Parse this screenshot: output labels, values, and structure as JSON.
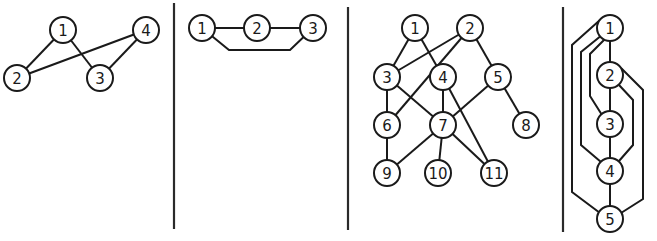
{
  "figure": {
    "panels": [
      {
        "id": "panel-1",
        "nodes": [
          {
            "id": "1",
            "label": "1",
            "x": 63,
            "y": 30
          },
          {
            "id": "2",
            "label": "2",
            "x": 17,
            "y": 78
          },
          {
            "id": "3",
            "label": "3",
            "x": 100,
            "y": 78
          },
          {
            "id": "4",
            "label": "4",
            "x": 146,
            "y": 30
          }
        ],
        "edges": [
          {
            "from": "1",
            "to": "2",
            "points": [
              [
                63,
                30
              ],
              [
                17,
                78
              ]
            ]
          },
          {
            "from": "1",
            "to": "3",
            "points": [
              [
                63,
                30
              ],
              [
                100,
                78
              ]
            ]
          },
          {
            "from": "2",
            "to": "4",
            "points": [
              [
                17,
                78
              ],
              [
                146,
                30
              ]
            ]
          },
          {
            "from": "3",
            "to": "4",
            "points": [
              [
                100,
                78
              ],
              [
                146,
                30
              ]
            ]
          }
        ]
      },
      {
        "id": "panel-2",
        "nodes": [
          {
            "id": "1",
            "label": "1",
            "x": 202,
            "y": 28
          },
          {
            "id": "2",
            "label": "2",
            "x": 257,
            "y": 28
          },
          {
            "id": "3",
            "label": "3",
            "x": 313,
            "y": 28
          }
        ],
        "edges": [
          {
            "from": "1",
            "to": "2",
            "points": [
              [
                202,
                28
              ],
              [
                257,
                28
              ]
            ]
          },
          {
            "from": "2",
            "to": "3",
            "points": [
              [
                257,
                28
              ],
              [
                313,
                28
              ]
            ]
          },
          {
            "from": "1",
            "to": "3",
            "points": [
              [
                202,
                28
              ],
              [
                229,
                50
              ],
              [
                290,
                50
              ],
              [
                313,
                28
              ]
            ]
          }
        ]
      },
      {
        "id": "panel-3",
        "nodes": [
          {
            "id": "1",
            "label": "1",
            "x": 415,
            "y": 28
          },
          {
            "id": "2",
            "label": "2",
            "x": 470,
            "y": 28
          },
          {
            "id": "3",
            "label": "3",
            "x": 387,
            "y": 77
          },
          {
            "id": "4",
            "label": "4",
            "x": 443,
            "y": 77
          },
          {
            "id": "5",
            "label": "5",
            "x": 498,
            "y": 77
          },
          {
            "id": "6",
            "label": "6",
            "x": 387,
            "y": 125
          },
          {
            "id": "7",
            "label": "7",
            "x": 443,
            "y": 125
          },
          {
            "id": "8",
            "label": "8",
            "x": 526,
            "y": 125
          },
          {
            "id": "9",
            "label": "9",
            "x": 387,
            "y": 173
          },
          {
            "id": "10",
            "label": "10",
            "x": 438,
            "y": 173
          },
          {
            "id": "11",
            "label": "11",
            "x": 494,
            "y": 173
          }
        ],
        "edges": [
          {
            "from": "1",
            "to": "3",
            "points": [
              [
                415,
                28
              ],
              [
                387,
                77
              ]
            ]
          },
          {
            "from": "1",
            "to": "4",
            "points": [
              [
                415,
                28
              ],
              [
                443,
                77
              ]
            ]
          },
          {
            "from": "2",
            "to": "3",
            "points": [
              [
                470,
                28
              ],
              [
                387,
                77
              ]
            ]
          },
          {
            "from": "2",
            "to": "6",
            "points": [
              [
                470,
                28
              ],
              [
                387,
                125
              ]
            ]
          },
          {
            "from": "2",
            "to": "5",
            "points": [
              [
                470,
                28
              ],
              [
                498,
                77
              ]
            ]
          },
          {
            "from": "3",
            "to": "6",
            "points": [
              [
                387,
                77
              ],
              [
                387,
                125
              ]
            ]
          },
          {
            "from": "3",
            "to": "7",
            "points": [
              [
                387,
                77
              ],
              [
                443,
                125
              ]
            ]
          },
          {
            "from": "4",
            "to": "7",
            "points": [
              [
                443,
                77
              ],
              [
                443,
                125
              ]
            ]
          },
          {
            "from": "4",
            "to": "11",
            "points": [
              [
                443,
                77
              ],
              [
                494,
                173
              ]
            ]
          },
          {
            "from": "5",
            "to": "7",
            "points": [
              [
                498,
                77
              ],
              [
                443,
                125
              ]
            ]
          },
          {
            "from": "5",
            "to": "8",
            "points": [
              [
                498,
                77
              ],
              [
                526,
                125
              ]
            ]
          },
          {
            "from": "6",
            "to": "9",
            "points": [
              [
                387,
                125
              ],
              [
                387,
                173
              ]
            ]
          },
          {
            "from": "7",
            "to": "9",
            "points": [
              [
                443,
                125
              ],
              [
                387,
                173
              ]
            ]
          },
          {
            "from": "7",
            "to": "10",
            "points": [
              [
                443,
                125
              ],
              [
                438,
                173
              ]
            ]
          },
          {
            "from": "7",
            "to": "11",
            "points": [
              [
                443,
                125
              ],
              [
                494,
                173
              ]
            ]
          }
        ]
      },
      {
        "id": "panel-4",
        "nodes": [
          {
            "id": "1",
            "label": "1",
            "x": 610,
            "y": 28
          },
          {
            "id": "2",
            "label": "2",
            "x": 610,
            "y": 75
          },
          {
            "id": "3",
            "label": "3",
            "x": 610,
            "y": 124
          },
          {
            "id": "4",
            "label": "4",
            "x": 610,
            "y": 171
          },
          {
            "id": "5",
            "label": "5",
            "x": 610,
            "y": 219
          }
        ],
        "edges": [
          {
            "from": "1",
            "to": "2",
            "points": [
              [
                610,
                28
              ],
              [
                610,
                75
              ]
            ]
          },
          {
            "from": "2",
            "to": "3",
            "points": [
              [
                610,
                75
              ],
              [
                610,
                124
              ]
            ]
          },
          {
            "from": "3",
            "to": "4",
            "points": [
              [
                610,
                124
              ],
              [
                610,
                171
              ]
            ]
          },
          {
            "from": "4",
            "to": "5",
            "points": [
              [
                610,
                171
              ],
              [
                610,
                219
              ]
            ]
          },
          {
            "from": "1",
            "to": "5",
            "points": [
              [
                600,
                20
              ],
              [
                572,
                45
              ],
              [
                572,
                192
              ],
              [
                600,
                213
              ]
            ]
          },
          {
            "from": "1",
            "to": "4",
            "points": [
              [
                602,
                35
              ],
              [
                581,
                52
              ],
              [
                581,
                145
              ],
              [
                601,
                162
              ]
            ]
          },
          {
            "from": "1",
            "to": "3",
            "points": [
              [
                605,
                39
              ],
              [
                590,
                54
              ],
              [
                590,
                96
              ],
              [
                602,
                115
              ]
            ]
          },
          {
            "from": "2",
            "to": "4",
            "points": [
              [
                619,
                85
              ],
              [
                633,
                100
              ],
              [
                633,
                145
              ],
              [
                619,
                161
              ]
            ]
          },
          {
            "from": "2",
            "to": "5",
            "points": [
              [
                621,
                68
              ],
              [
                643,
                90
              ],
              [
                643,
                199
              ],
              [
                621,
                213
              ]
            ]
          }
        ]
      }
    ],
    "dividers": [
      {
        "x": 174,
        "y1": 3,
        "y2": 229
      },
      {
        "x": 348,
        "y1": 7,
        "y2": 230
      },
      {
        "x": 563,
        "y1": 7,
        "y2": 232
      }
    ],
    "node_radius": 13
  }
}
